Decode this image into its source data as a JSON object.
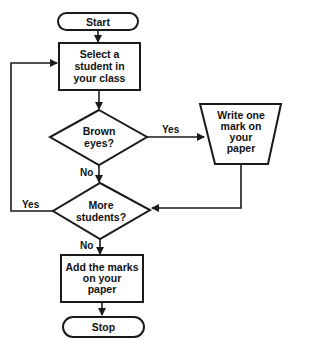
{
  "diagram": {
    "type": "flowchart",
    "colors": {
      "stroke": "#1a1a1a",
      "fill": "#ffffff",
      "text": "#111111"
    },
    "nodes": {
      "start": {
        "shape": "terminal",
        "lines": [
          "Start"
        ]
      },
      "select": {
        "shape": "process",
        "lines": [
          "Select a",
          "student in",
          "your class"
        ]
      },
      "brown": {
        "shape": "decision",
        "lines": [
          "Brown",
          "eyes?"
        ]
      },
      "write": {
        "shape": "manual-operation",
        "lines": [
          "Write one",
          "mark on",
          "your",
          "paper"
        ]
      },
      "more": {
        "shape": "decision",
        "lines": [
          "More",
          "students?"
        ]
      },
      "add": {
        "shape": "process",
        "lines": [
          "Add the marks",
          "on your",
          "paper"
        ]
      },
      "stop": {
        "shape": "terminal",
        "lines": [
          "Stop"
        ]
      }
    },
    "edges": {
      "brown_yes": "Yes",
      "brown_no": "No",
      "more_yes": "Yes",
      "more_no": "No"
    }
  }
}
